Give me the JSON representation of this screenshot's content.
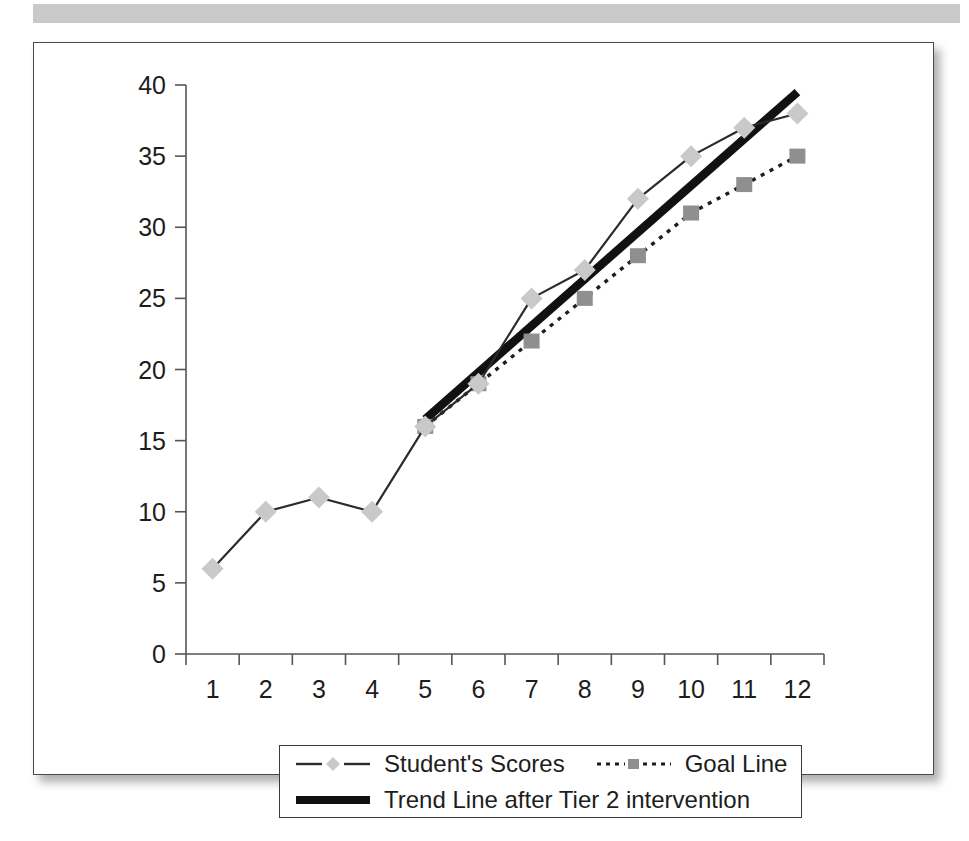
{
  "page": {
    "artifact_bar_color": "#c9c9c9",
    "card_background": "#ffffff",
    "card_border_color": "#4a4a4a"
  },
  "legend": {
    "position": "below-axis",
    "entries": [
      {
        "label": "Student's Scores",
        "marker": "diamond-marker-icon",
        "line_style": "solid",
        "color": "#c9c9c9"
      },
      {
        "label": "Goal Line",
        "marker": "square-marker-icon",
        "line_style": "dotted",
        "color": "#8f8f8f"
      },
      {
        "label": "Trend Line after Tier 2 intervention",
        "marker": "thick-line-icon",
        "line_style": "solid-thick",
        "color": "#111111"
      }
    ]
  },
  "chart_data": {
    "type": "line",
    "title": "",
    "xlabel": "",
    "ylabel": "",
    "x": [
      1,
      2,
      3,
      4,
      5,
      6,
      7,
      8,
      9,
      10,
      11,
      12
    ],
    "xtick_labels": [
      "1",
      "2",
      "3",
      "4",
      "5",
      "6",
      "7",
      "8",
      "9",
      "10",
      "11",
      "12"
    ],
    "ytick_labels": [
      "0",
      "5",
      "10",
      "15",
      "20",
      "25",
      "30",
      "35",
      "40"
    ],
    "yticks": [
      0,
      5,
      10,
      15,
      20,
      25,
      30,
      35,
      40
    ],
    "ylim": [
      0,
      40
    ],
    "xlim": [
      0.5,
      12.5
    ],
    "grid": false,
    "legend_position": "bottom",
    "series": [
      {
        "name": "Student's Scores",
        "marker": "diamond",
        "line_style": "solid",
        "color": "#c9c9c9",
        "x": [
          1,
          2,
          3,
          4,
          5,
          6,
          7,
          8,
          9,
          10,
          11,
          12
        ],
        "values": [
          6,
          10,
          11,
          10,
          16,
          19,
          25,
          27,
          32,
          35,
          37,
          38
        ]
      },
      {
        "name": "Goal Line",
        "marker": "square",
        "line_style": "dotted",
        "color": "#8f8f8f",
        "x": [
          5,
          6,
          7,
          8,
          9,
          10,
          11,
          12
        ],
        "values": [
          16,
          19,
          22,
          25,
          28,
          31,
          33,
          35
        ]
      },
      {
        "name": "Trend Line after Tier 2 intervention",
        "marker": "none",
        "line_style": "solid-thick",
        "color": "#111111",
        "x": [
          5,
          12
        ],
        "values": [
          16.5,
          39.5
        ]
      }
    ]
  }
}
